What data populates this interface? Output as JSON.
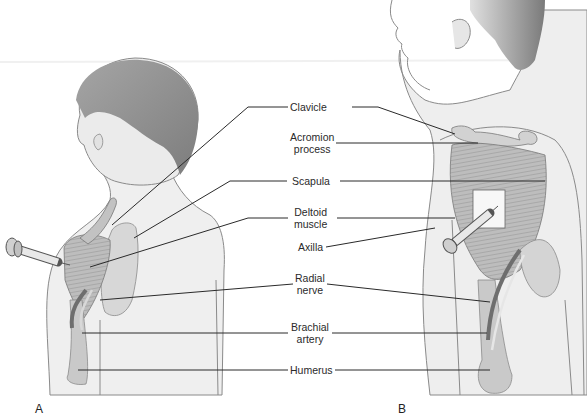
{
  "figure": {
    "panels": [
      {
        "id": "A",
        "label": "A",
        "description": "Child seen from behind; intramuscular injection into deltoid"
      },
      {
        "id": "B",
        "label": "B",
        "description": "Older child side view; injection into deltoid with landmark rectangle"
      }
    ],
    "labels": [
      {
        "id": "clavicle",
        "line1": "Clavicle",
        "line2": ""
      },
      {
        "id": "acromion",
        "line1": "Acromion",
        "line2": "process"
      },
      {
        "id": "scapula",
        "line1": "Scapula",
        "line2": ""
      },
      {
        "id": "deltoid",
        "line1": "Deltoid",
        "line2": "muscle"
      },
      {
        "id": "axilla",
        "line1": "Axilla",
        "line2": ""
      },
      {
        "id": "radial",
        "line1": "Radial",
        "line2": "nerve"
      },
      {
        "id": "brachial",
        "line1": "Brachial",
        "line2": "artery"
      },
      {
        "id": "humerus",
        "line1": "Humerus",
        "line2": ""
      }
    ]
  },
  "colors": {
    "skin_outline": "#8a8a8a",
    "skin_fill": "#eeeeee",
    "hair": "#8f8f8f",
    "muscle": "#b5b5b5",
    "bone": "#c9c9c9",
    "vessel": "#6e6e6e",
    "leader_line": "#2a2a2a"
  }
}
